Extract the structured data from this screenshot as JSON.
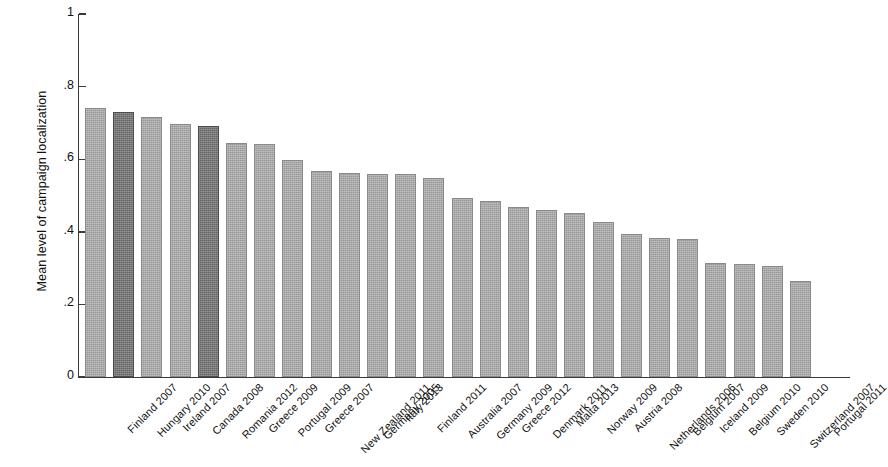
{
  "chart_data": {
    "type": "bar",
    "title": "",
    "subtitle": "",
    "xlabel": "",
    "ylabel": "Mean level of campaign localization",
    "ylim": [
      0,
      1
    ],
    "ytick_labels": [
      "0",
      ".2",
      ".4",
      ".6",
      ".8",
      "1"
    ],
    "ytick_values": [
      0,
      0.2,
      0.4,
      0.6,
      0.8,
      1
    ],
    "grid": false,
    "legend": null,
    "categories": [
      "Finland 2007",
      "Hungary 2010",
      "Ireland 2007",
      "Canada 2008",
      "Romania 2012",
      "Greece 2009",
      "Portugal 2009",
      "Greece 2007",
      "New Zealand 2011",
      "Germany 2005",
      "Italy 2013",
      "Finland 2011",
      "Australia 2007",
      "Germany 2009",
      "Greece 2012",
      "Denmark 2011",
      "Malta 2013",
      "Norway 2009",
      "Austria 2008",
      "Netherlands 2006",
      "Belgium 2007",
      "Iceland 2009",
      "Belgium 2010",
      "Sweden 2010",
      "Switzerland 2007",
      "Portugal 2011"
    ],
    "values": [
      0.742,
      0.731,
      0.716,
      0.697,
      0.691,
      0.646,
      0.641,
      0.597,
      0.568,
      0.562,
      0.56,
      0.559,
      0.549,
      0.492,
      0.486,
      0.468,
      0.461,
      0.452,
      0.428,
      0.394,
      0.383,
      0.379,
      0.313,
      0.312,
      0.306,
      0.264
    ],
    "highlighted_categories": [
      "Hungary 2010",
      "Romania 2012"
    ],
    "colors": {
      "bar": "#a8a8a8",
      "bar_border": "#8a8a8a",
      "bar_highlight": "#6e6e6e",
      "bar_highlight_border": "#4c4c4c",
      "axis": "#3a3a3a",
      "text": "#111111",
      "background": "#ffffff"
    }
  }
}
